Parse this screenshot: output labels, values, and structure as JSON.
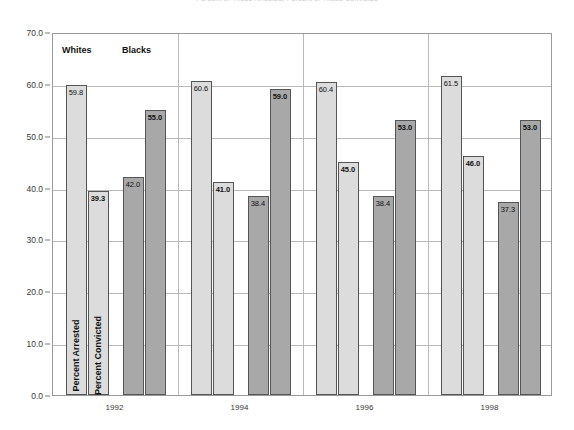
{
  "chart_data": {
    "type": "bar",
    "title": "Percent of Those Arrested; Percent of Those Convicted",
    "xlabel": "",
    "ylabel": "",
    "ylim": [
      0.0,
      70.0
    ],
    "ytick_labels": [
      "70.0",
      "60.0",
      "50.0",
      "40.0",
      "30.0",
      "20.0",
      "10.0",
      "0.0"
    ],
    "ytick_values": [
      70.0,
      60.0,
      50.0,
      40.0,
      30.0,
      20.0,
      10.0,
      0.0
    ],
    "grid": true,
    "legend_position": "inside-top-left",
    "categories": [
      "1992",
      "1994",
      "1996",
      "1998"
    ],
    "series": [
      {
        "name": "Whites Percent Arrested",
        "group": "Whites",
        "measure": "Percent Arrested",
        "color": "#dcdcdc",
        "values": [
          59.8,
          60.6,
          60.4,
          61.5
        ],
        "labels": [
          "59.8",
          "60.6",
          "60.4",
          "61.5"
        ],
        "label_bold": [
          false,
          false,
          false,
          false
        ]
      },
      {
        "name": "Whites Percent Convicted",
        "group": "Whites",
        "measure": "Percent Convicted",
        "color": "#dcdcdc",
        "values": [
          39.3,
          41.0,
          45.0,
          46.0
        ],
        "labels": [
          "39.3",
          "41.0",
          "45.0",
          "46.0"
        ],
        "label_bold": [
          true,
          true,
          true,
          true
        ]
      },
      {
        "name": "Blacks Percent Arrested",
        "group": "Blacks",
        "measure": "Percent Arrested",
        "color": "#a8a8a8",
        "values": [
          42.0,
          38.4,
          38.4,
          37.3
        ],
        "labels": [
          "42.0",
          "38.4",
          "38.4",
          "37.3"
        ],
        "label_bold": [
          false,
          false,
          false,
          false
        ]
      },
      {
        "name": "Blacks Percent Convicted",
        "group": "Blacks",
        "measure": "Percent Convicted",
        "color": "#a8a8a8",
        "values": [
          55.0,
          59.0,
          53.0,
          53.0
        ],
        "labels": [
          "55.0",
          "59.0",
          "53.0",
          "53.0"
        ],
        "label_bold": [
          true,
          true,
          true,
          true
        ]
      }
    ],
    "legend": [
      {
        "label": "Whites",
        "color": "#dcdcdc"
      },
      {
        "label": "Blacks",
        "color": "#a8a8a8"
      }
    ],
    "in_bar_labels": [
      {
        "text": "Percent Arrested",
        "series": 0,
        "category": 0
      },
      {
        "text": "Percent Convicted",
        "series": 1,
        "category": 0
      }
    ]
  }
}
